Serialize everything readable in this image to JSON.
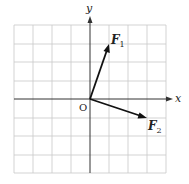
{
  "diagram": {
    "type": "vector-diagram",
    "grid": {
      "cells_x": 8,
      "cells_y": 8,
      "x_range": [
        -4,
        4
      ],
      "y_range": [
        -4,
        4
      ]
    },
    "axes": {
      "x_label": "x",
      "y_label": "y",
      "origin_label": "O"
    },
    "vectors": [
      {
        "name": "F",
        "subscript": "1",
        "from": [
          0,
          0
        ],
        "to": [
          1,
          3
        ]
      },
      {
        "name": "F",
        "subscript": "2",
        "from": [
          0,
          0
        ],
        "to": [
          3,
          -1
        ]
      }
    ],
    "colors": {
      "grid": "#c8c8c8",
      "axis": "#333333",
      "vector": "#111111"
    }
  }
}
